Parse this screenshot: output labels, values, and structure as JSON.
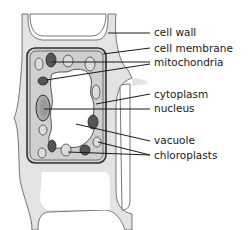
{
  "diagram": {
    "labels": [
      {
        "id": "cell-wall",
        "text": "cell wall",
        "x": 154,
        "y": 36
      },
      {
        "id": "cell-membrane",
        "text": "cell membrane",
        "x": 154,
        "y": 52
      },
      {
        "id": "mitochondria",
        "text": "mitochondria",
        "x": 154,
        "y": 66
      },
      {
        "id": "cytoplasm",
        "text": "cytoplasm",
        "x": 154,
        "y": 98
      },
      {
        "id": "nucleus",
        "text": "nucleus",
        "x": 154,
        "y": 112
      },
      {
        "id": "vacuole",
        "text": "vacuole",
        "x": 154,
        "y": 144
      },
      {
        "id": "chloroplasts",
        "text": "chloroplasts",
        "x": 154,
        "y": 159
      }
    ],
    "colors": {
      "wall_fill": "#e3e3e3",
      "cytoplasm_fill": "#cfcfcf",
      "vacuole_fill": "#ffffff",
      "outline": "#3a3a3a"
    }
  }
}
